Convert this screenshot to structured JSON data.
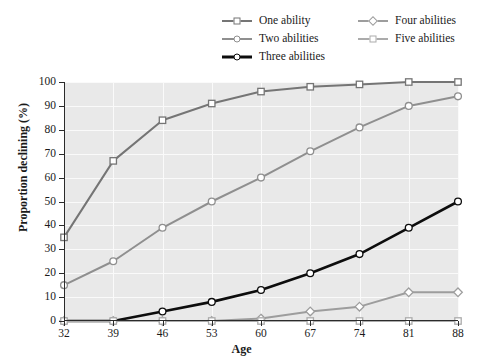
{
  "chart_data": {
    "type": "line",
    "title": "",
    "xlabel": "Age",
    "ylabel": "Proportion declining (%)",
    "x": [
      32,
      39,
      46,
      53,
      60,
      67,
      74,
      81,
      88
    ],
    "xtick_labels": [
      "32",
      "39",
      "46",
      "53",
      "60",
      "67",
      "74",
      "81",
      "88"
    ],
    "ytick_labels": [
      "0",
      "10",
      "20",
      "30",
      "40",
      "50",
      "60",
      "70",
      "80",
      "90",
      "100"
    ],
    "yticks": [
      0,
      10,
      20,
      30,
      40,
      50,
      60,
      70,
      80,
      90,
      100
    ],
    "xlim": [
      32,
      88
    ],
    "ylim": [
      0,
      100
    ],
    "grid": true,
    "grid_color": "#fafafa",
    "plot_background": "#e9e9e9",
    "legend_position": "top-center",
    "series": [
      {
        "name": "One ability",
        "values": [
          35,
          67,
          84,
          91,
          96,
          98,
          99,
          100,
          100
        ],
        "color": "#757575",
        "marker": "square",
        "line_width": 2.0
      },
      {
        "name": "Two abilities",
        "values": [
          15,
          25,
          39,
          50,
          60,
          71,
          81,
          90,
          94
        ],
        "color": "#8f8f8f",
        "marker": "circle",
        "line_width": 2.0
      },
      {
        "name": "Three abilities",
        "values": [
          0,
          0,
          4,
          8,
          13,
          20,
          28,
          39,
          50
        ],
        "color": "#0d0d0d",
        "marker": "circle",
        "line_width": 2.6
      },
      {
        "name": "Four abilities",
        "values": [
          0,
          0,
          0,
          0,
          1,
          4,
          6,
          12,
          12
        ],
        "color": "#9d9d9d",
        "marker": "diamond",
        "line_width": 2.0
      },
      {
        "name": "Five abilities",
        "values": [
          0,
          0,
          0,
          0,
          0,
          0,
          0,
          0,
          0
        ],
        "color": "#ababab",
        "marker": "square",
        "line_width": 2.0
      }
    ]
  },
  "legend": {
    "columns": [
      {
        "items": [
          0,
          1,
          2
        ]
      },
      {
        "items": [
          3,
          4
        ]
      }
    ]
  }
}
